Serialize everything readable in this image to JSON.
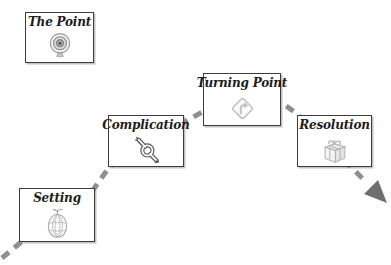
{
  "nodes": [
    {
      "id": "the-point",
      "label": "The Point",
      "icon": "target"
    },
    {
      "id": "setting",
      "label": "Setting",
      "icon": "hot-air-balloon"
    },
    {
      "id": "complication",
      "label": "Complication",
      "icon": "knot"
    },
    {
      "id": "turning-point",
      "label": "Turning Point",
      "icon": "turn-sign"
    },
    {
      "id": "resolution",
      "label": "Resolution",
      "icon": "gift"
    }
  ],
  "flow": {
    "style": "dashed",
    "order": [
      "Setting",
      "Complication",
      "Turning Point",
      "Resolution"
    ],
    "dash_color": "#8f8f8f",
    "arrowhead_color": "#6f6f6f"
  },
  "colors": {
    "background": "#ffffff",
    "box_background": "#ffffff",
    "box_border": "#3d3d3d",
    "title_text": "#1c1c1c",
    "icon_light_gray": "#b3b3b3",
    "icon_dark_gray": "#555555"
  }
}
